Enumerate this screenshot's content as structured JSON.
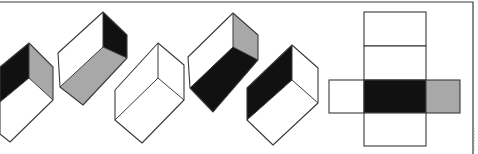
{
  "title": "Cube net folding puzzle",
  "colors": {
    "background": "#ffffff",
    "line": "#3a3a3a",
    "black": "#111111",
    "gray": "#a8a8a8",
    "white": "#ffffff"
  },
  "frame": {
    "top_y": 2,
    "right_x": 473
  },
  "options": [
    {
      "id": "box-1",
      "faces": [
        {
          "name": "left-wall",
          "fill": "black",
          "points": "0,67 29,43 29,78 0,102"
        },
        {
          "name": "right-wall",
          "fill": "gray",
          "points": "29,43 53,67 53,100 29,78"
        },
        {
          "name": "floor",
          "fill": "white",
          "points": "0,102 29,78 53,100 10,142 0,134"
        }
      ],
      "outline": "0,67 29,43 53,67 53,100 10,142 0,134",
      "inner_lines": [
        "29,43 29,78",
        "0,102 29,78 53,100"
      ]
    },
    {
      "id": "box-2",
      "faces": [
        {
          "name": "left-wall",
          "fill": "white",
          "points": "58,53 103,12 103,47 60,87"
        },
        {
          "name": "right-wall",
          "fill": "black",
          "points": "103,12 127,35 127,58 103,47"
        },
        {
          "name": "floor",
          "fill": "gray",
          "points": "60,87 103,47 127,58 83,105"
        }
      ],
      "outline": "58,53 103,12 127,35 127,58 83,105 60,87",
      "inner_lines": [
        "103,12 103,47",
        "60,87 103,47 127,58"
      ]
    },
    {
      "id": "box-3",
      "faces": [
        {
          "name": "left-wall",
          "fill": "white",
          "points": "115,90 158,43 158,78 115,120"
        },
        {
          "name": "right-wall",
          "fill": "white",
          "points": "158,43 184,65 184,100 158,78"
        },
        {
          "name": "floor",
          "fill": "white",
          "points": "115,120 158,78 184,100 142,143"
        }
      ],
      "outline": "115,90 158,43 184,65 184,100 142,143 115,120",
      "inner_lines": [
        "158,43 158,78",
        "115,120 158,78 184,100"
      ]
    },
    {
      "id": "box-4",
      "faces": [
        {
          "name": "left-wall",
          "fill": "white",
          "points": "188,57 233,13 233,47 190,88"
        },
        {
          "name": "right-wall",
          "fill": "gray",
          "points": "233,13 258,35 258,60 233,47"
        },
        {
          "name": "floor",
          "fill": "black",
          "points": "190,88 233,47 258,60 213,112"
        }
      ],
      "outline": "188,57 233,13 258,35 258,60 213,112 190,88",
      "inner_lines": [
        "233,13 233,47",
        "190,88 233,47 258,60"
      ]
    },
    {
      "id": "box-5",
      "faces": [
        {
          "name": "left-wall",
          "fill": "black",
          "points": "247,88 292,45 292,80 247,120"
        },
        {
          "name": "right-wall",
          "fill": "white",
          "points": "292,45 318,68 318,103 292,80"
        },
        {
          "name": "floor",
          "fill": "white",
          "points": "247,120 292,80 318,103 273,145"
        }
      ],
      "outline": "247,88 292,45 318,68 318,103 273,145 247,120",
      "inner_lines": [
        "292,45 292,80",
        "247,120 292,80 318,103"
      ]
    }
  ],
  "net": {
    "squares": [
      {
        "name": "net-top-1",
        "x": 364,
        "y": 12,
        "w": 62,
        "h": 34,
        "fill": "white"
      },
      {
        "name": "net-top-2",
        "x": 364,
        "y": 46,
        "w": 62,
        "h": 34,
        "fill": "white"
      },
      {
        "name": "net-left",
        "x": 329,
        "y": 80,
        "w": 35,
        "h": 33,
        "fill": "white"
      },
      {
        "name": "net-center",
        "x": 364,
        "y": 80,
        "w": 62,
        "h": 33,
        "fill": "black"
      },
      {
        "name": "net-right",
        "x": 426,
        "y": 80,
        "w": 34,
        "h": 33,
        "fill": "gray"
      },
      {
        "name": "net-bottom",
        "x": 364,
        "y": 113,
        "w": 62,
        "h": 33,
        "fill": "white"
      }
    ]
  }
}
